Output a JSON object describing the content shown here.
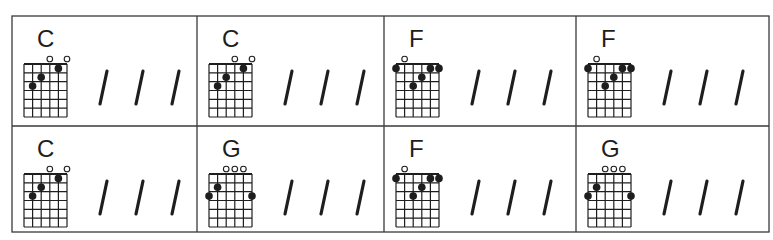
{
  "sheet": {
    "title": "Chord chart",
    "colors": {
      "line": "#3a3a3a",
      "ink": "#1e1e1e",
      "background": "#ffffff"
    },
    "strings": 6,
    "frets": 6,
    "beats_per_measure": 4,
    "slash_symbol": "/",
    "open_symbol": "o"
  },
  "chords": {
    "C": {
      "name": "C",
      "open": [
        3,
        5
      ],
      "dots": [
        [
          1,
          3
        ],
        [
          2,
          2
        ],
        [
          4,
          1
        ]
      ]
    },
    "G": {
      "name": "G",
      "open": [
        2,
        3,
        4
      ],
      "dots": [
        [
          0,
          3
        ],
        [
          1,
          2
        ],
        [
          5,
          3
        ]
      ]
    },
    "F": {
      "name": "F",
      "open": [
        1
      ],
      "dots": [
        [
          0,
          1
        ],
        [
          2,
          3
        ],
        [
          3,
          2
        ],
        [
          4,
          1
        ],
        [
          5,
          1
        ]
      ]
    }
  },
  "rows": [
    {
      "measures": [
        {
          "chord": "C",
          "slashes": 3
        },
        {
          "chord": "C",
          "slashes": 3
        },
        {
          "chord": "F",
          "slashes": 3
        },
        {
          "chord": "F",
          "slashes": 3
        }
      ]
    },
    {
      "measures": [
        {
          "chord": "C",
          "slashes": 3
        },
        {
          "chord": "G",
          "slashes": 3
        },
        {
          "chord": "F",
          "slashes": 3
        },
        {
          "chord": "G",
          "slashes": 3
        }
      ]
    }
  ]
}
